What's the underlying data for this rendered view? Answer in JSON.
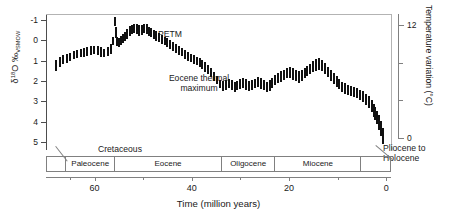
{
  "chart_data": {
    "type": "scatter",
    "title": "",
    "xlabel": "Time (million years)",
    "ylabel": "δ¹⁸O ‰VSMOW",
    "ylabel_parts": {
      "delta": "δ",
      "sup": "18",
      "o": "O ‰",
      "sub": "VSMOW"
    },
    "y2label": "Temperature variation (°C)",
    "xlim": [
      70,
      -1
    ],
    "ylim": [
      5.4,
      -1.3
    ],
    "y2lim": [
      0,
      13.2
    ],
    "grid": false,
    "legend": null,
    "y_inverted": true,
    "yticks": [
      -1,
      0,
      1,
      2,
      3,
      4,
      5
    ],
    "yticklabels": [
      "-1",
      "0",
      "1",
      "2",
      "3",
      "4",
      "5"
    ],
    "y2ticks": [
      0,
      4,
      8,
      12
    ],
    "y2ticklabels": [
      "0",
      "",
      "",
      "12"
    ],
    "xticks_major": [
      60,
      40,
      20,
      0
    ],
    "xticklabels_major": [
      "60",
      "40",
      "20",
      "0"
    ],
    "xticks_minor": [
      65,
      50,
      30,
      10
    ],
    "marker_style": "vertical-error-bar",
    "marker_color": "#111111",
    "x": [
      68.0,
      67.2,
      66.4,
      65.7,
      65.0,
      64.3,
      63.6,
      62.9,
      62.2,
      61.5,
      60.8,
      60.1,
      59.4,
      58.7,
      58.0,
      57.3,
      56.6,
      56.2,
      55.9,
      55.6,
      55.3,
      55.0,
      54.6,
      54.2,
      53.8,
      53.3,
      52.8,
      52.3,
      51.8,
      51.3,
      50.8,
      50.3,
      49.8,
      49.3,
      48.8,
      48.3,
      47.8,
      47.3,
      46.8,
      46.2,
      45.6,
      45.0,
      44.4,
      43.8,
      43.2,
      42.6,
      42.0,
      41.4,
      40.8,
      40.2,
      39.6,
      39.0,
      38.4,
      37.8,
      37.2,
      36.6,
      36.0,
      35.4,
      34.8,
      34.2,
      33.6,
      33.0,
      32.4,
      31.8,
      31.2,
      30.6,
      30.0,
      29.4,
      28.8,
      28.2,
      27.6,
      27.0,
      26.4,
      25.8,
      25.2,
      24.6,
      24.0,
      23.4,
      22.8,
      22.2,
      21.6,
      21.0,
      20.4,
      19.8,
      19.2,
      18.6,
      18.0,
      17.4,
      16.8,
      16.2,
      15.6,
      15.0,
      14.4,
      13.8,
      13.2,
      12.6,
      12.0,
      11.4,
      10.8,
      10.2,
      9.6,
      9.0,
      8.4,
      7.8,
      7.2,
      6.6,
      6.0,
      5.4,
      4.8,
      4.2,
      3.6,
      3.0,
      2.6,
      2.2,
      1.8,
      1.4,
      1.0,
      0.7,
      0.4,
      0.2
    ],
    "y": [
      1.25,
      1.05,
      0.95,
      0.88,
      0.8,
      0.72,
      0.68,
      0.62,
      0.58,
      0.55,
      0.5,
      0.48,
      0.52,
      0.58,
      0.62,
      0.55,
      0.42,
      0.05,
      -0.95,
      -0.4,
      0.05,
      0.1,
      0.0,
      -0.1,
      -0.2,
      -0.32,
      -0.45,
      -0.52,
      -0.58,
      -0.55,
      -0.48,
      -0.52,
      -0.6,
      -0.55,
      -0.45,
      -0.38,
      -0.3,
      -0.22,
      -0.12,
      -0.05,
      0.02,
      0.12,
      0.22,
      0.3,
      0.38,
      0.48,
      0.58,
      0.68,
      0.78,
      0.88,
      0.95,
      1.02,
      1.1,
      1.2,
      1.32,
      1.45,
      1.6,
      1.78,
      1.95,
      2.15,
      2.25,
      2.2,
      2.12,
      2.2,
      2.28,
      2.22,
      2.15,
      2.1,
      2.18,
      2.25,
      2.2,
      2.12,
      2.05,
      2.12,
      2.2,
      2.28,
      2.22,
      2.1,
      1.95,
      1.85,
      1.78,
      1.7,
      1.62,
      1.58,
      1.65,
      1.72,
      1.8,
      1.72,
      1.6,
      1.5,
      1.42,
      1.3,
      1.22,
      1.18,
      1.25,
      1.38,
      1.55,
      1.72,
      1.88,
      2.02,
      2.15,
      2.28,
      2.38,
      2.45,
      2.5,
      2.55,
      2.6,
      2.68,
      2.78,
      2.9,
      3.05,
      3.25,
      3.45,
      3.6,
      3.8,
      4.05,
      4.35,
      4.7
    ],
    "yerr": [
      0.28,
      0.24,
      0.22,
      0.22,
      0.2,
      0.2,
      0.2,
      0.2,
      0.22,
      0.2,
      0.22,
      0.2,
      0.22,
      0.24,
      0.22,
      0.24,
      0.26,
      0.2,
      0.22,
      0.26,
      0.24,
      0.22,
      0.22,
      0.22,
      0.22,
      0.24,
      0.24,
      0.22,
      0.22,
      0.24,
      0.26,
      0.24,
      0.22,
      0.24,
      0.22,
      0.22,
      0.22,
      0.24,
      0.22,
      0.22,
      0.2,
      0.22,
      0.22,
      0.2,
      0.22,
      0.22,
      0.2,
      0.22,
      0.22,
      0.2,
      0.22,
      0.2,
      0.22,
      0.22,
      0.24,
      0.22,
      0.22,
      0.24,
      0.22,
      0.22,
      0.26,
      0.26,
      0.24,
      0.26,
      0.24,
      0.24,
      0.26,
      0.24,
      0.26,
      0.24,
      0.24,
      0.24,
      0.24,
      0.26,
      0.26,
      0.24,
      0.26,
      0.26,
      0.26,
      0.24,
      0.26,
      0.26,
      0.24,
      0.26,
      0.28,
      0.28,
      0.28,
      0.26,
      0.26,
      0.26,
      0.26,
      0.28,
      0.3,
      0.3,
      0.28,
      0.28,
      0.26,
      0.26,
      0.26,
      0.26,
      0.26,
      0.24,
      0.26,
      0.24,
      0.24,
      0.26,
      0.26,
      0.26,
      0.28,
      0.28,
      0.3,
      0.3,
      0.32,
      0.34,
      0.34,
      0.36,
      0.38,
      0.4,
      0.42,
      0.44
    ],
    "annotations": [
      {
        "name": "petm",
        "text": "PETM",
        "x": 56.6,
        "y": -1.15
      },
      {
        "name": "eocene-thermal-maximum",
        "text": "Eocene thermal maximum",
        "x": 50.0,
        "y": 1.25
      },
      {
        "name": "cretaceous",
        "text": "Cretaceous",
        "x": 66.5,
        "y": 4.05
      },
      {
        "name": "pliocene-to-holocene",
        "text": "Pliocene to Holocene",
        "x": 8.0,
        "y": 4.05
      }
    ],
    "epochs": [
      {
        "name": "cretaceous",
        "label": "",
        "start": 70,
        "end": 66.0
      },
      {
        "name": "paleocene",
        "label": "Paleocene",
        "start": 66.0,
        "end": 56.0
      },
      {
        "name": "eocene",
        "label": "Eocene",
        "start": 56.0,
        "end": 34.0
      },
      {
        "name": "oligocene",
        "label": "Oligocene",
        "start": 34.0,
        "end": 23.0
      },
      {
        "name": "miocene",
        "label": "Miocene",
        "start": 23.0,
        "end": 5.3
      },
      {
        "name": "pliocene-to-holocene",
        "label": "",
        "start": 5.3,
        "end": -1
      }
    ]
  }
}
